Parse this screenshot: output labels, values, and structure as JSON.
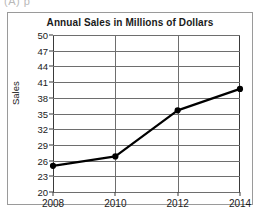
{
  "stem": {
    "text": "(A)        p"
  },
  "chart_data": {
    "type": "line",
    "title": "Annual Sales in Millions of Dollars",
    "xlabel": "",
    "ylabel": "Sales",
    "categories": [
      "2008",
      "2010",
      "2012",
      "2014"
    ],
    "x": [
      2008,
      2010,
      2012,
      2014
    ],
    "values": [
      25.0,
      26.8,
      35.6,
      39.7
    ],
    "series": [
      {
        "name": "Sales",
        "values": [
          25.0,
          26.8,
          35.6,
          39.7
        ]
      }
    ],
    "xlim": [
      2008,
      2014
    ],
    "ylim": [
      20,
      50
    ],
    "ytick_step": 3,
    "yticks": [
      20,
      23,
      26,
      29,
      32,
      35,
      38,
      41,
      44,
      47,
      50
    ],
    "ytick_labels": [
      "20",
      "23",
      "26",
      "29",
      "32",
      "35",
      "38",
      "41",
      "44",
      "47",
      "50"
    ],
    "xticks": [
      2008,
      2010,
      2012,
      2014
    ],
    "xtick_labels": [
      "2008",
      "2010",
      "2012",
      "2014"
    ],
    "grid": "both",
    "legend": "none",
    "marker": "filled-circle",
    "line_color": "#000000",
    "grid_color": "#6e6e6e",
    "axis_color": "#3a3a3a",
    "background_color": "#ffffff"
  }
}
